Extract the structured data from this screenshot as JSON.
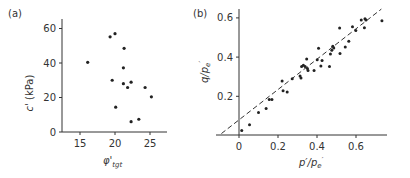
{
  "figure": {
    "panel_a_label": "(a)",
    "panel_b_label": "(b)"
  },
  "chart_data": [
    {
      "panel": "(a)",
      "type": "scatter",
      "title": "",
      "xlabel": "φ'tgt",
      "xlabel_main": "φ'",
      "xlabel_sub": "tgt",
      "ylabel": "c' (kPa)",
      "ylabel_main": "c'",
      "ylabel_unit": "(kPa)",
      "xlim": [
        12.5,
        27.5
      ],
      "ylim": [
        0,
        62
      ],
      "xticks": [
        15,
        20,
        25
      ],
      "yticks": [
        0,
        20,
        40,
        60
      ],
      "grid": false,
      "legend": null,
      "series": [
        {
          "name": "data",
          "color": "#222222",
          "points": [
            [
              16.1,
              40.4
            ],
            [
              19.3,
              55.2
            ],
            [
              20.0,
              57.0
            ],
            [
              21.3,
              48.5
            ],
            [
              21.2,
              37.2
            ],
            [
              19.6,
              30.0
            ],
            [
              21.2,
              28.0
            ],
            [
              21.8,
              25.8
            ],
            [
              22.3,
              28.9
            ],
            [
              24.3,
              25.8
            ],
            [
              25.2,
              20.4
            ],
            [
              20.1,
              14.4
            ],
            [
              22.3,
              6.0
            ],
            [
              23.4,
              7.4
            ]
          ]
        }
      ]
    },
    {
      "panel": "(b)",
      "type": "scatter",
      "title": "",
      "xlabel": "p'/p'e",
      "ylabel": "q/p'e",
      "xlim": [
        -0.12,
        0.76
      ],
      "ylim": [
        0,
        0.64
      ],
      "xticks": [
        0,
        0.2,
        0.4,
        0.6
      ],
      "yticks": [
        0.2,
        0.4,
        0.6
      ],
      "grid": false,
      "legend": null,
      "series": [
        {
          "name": "data",
          "color": "#222222",
          "points": [
            [
              0.014,
              0.026
            ],
            [
              0.054,
              0.055
            ],
            [
              0.1,
              0.117
            ],
            [
              0.139,
              0.138
            ],
            [
              0.155,
              0.184
            ],
            [
              0.169,
              0.184
            ],
            [
              0.221,
              0.278
            ],
            [
              0.226,
              0.228
            ],
            [
              0.247,
              0.222
            ],
            [
              0.273,
              0.29
            ],
            [
              0.313,
              0.304
            ],
            [
              0.318,
              0.294
            ],
            [
              0.321,
              0.352
            ],
            [
              0.33,
              0.359
            ],
            [
              0.339,
              0.352
            ],
            [
              0.347,
              0.39
            ],
            [
              0.351,
              0.342
            ],
            [
              0.354,
              0.331
            ],
            [
              0.385,
              0.331
            ],
            [
              0.401,
              0.387
            ],
            [
              0.408,
              0.445
            ],
            [
              0.42,
              0.354
            ],
            [
              0.426,
              0.383
            ],
            [
              0.464,
              0.352
            ],
            [
              0.469,
              0.416
            ],
            [
              0.476,
              0.435
            ],
            [
              0.481,
              0.455
            ],
            [
              0.486,
              0.447
            ],
            [
              0.516,
              0.548
            ],
            [
              0.518,
              0.418
            ],
            [
              0.545,
              0.452
            ],
            [
              0.563,
              0.481
            ],
            [
              0.582,
              0.555
            ],
            [
              0.599,
              0.536
            ],
            [
              0.627,
              0.589
            ],
            [
              0.643,
              0.55
            ],
            [
              0.646,
              0.596
            ],
            [
              0.651,
              0.589
            ],
            [
              0.733,
              0.586
            ]
          ]
        },
        {
          "name": "fit line (dashed)",
          "type": "line",
          "style": "dashed",
          "color": "#222222",
          "points": [
            [
              -0.09,
              0.01
            ],
            [
              0.73,
              0.645
            ]
          ]
        }
      ]
    }
  ]
}
